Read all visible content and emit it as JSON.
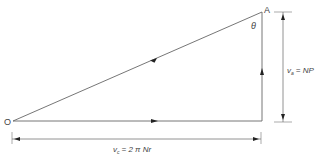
{
  "diagram": {
    "type": "velocity-triangle",
    "points": {
      "origin": {
        "label": "O"
      },
      "apex": {
        "label": "A"
      }
    },
    "angle_label": "θ",
    "vertical_dimension": {
      "symbol": "v",
      "subscript": "a",
      "expression": "= NP"
    },
    "horizontal_dimension": {
      "symbol": "v",
      "subscript": "c",
      "expression": "= 2 π Nr"
    },
    "colors": {
      "line": "#555555",
      "text": "#444444",
      "background": "#ffffff"
    }
  }
}
